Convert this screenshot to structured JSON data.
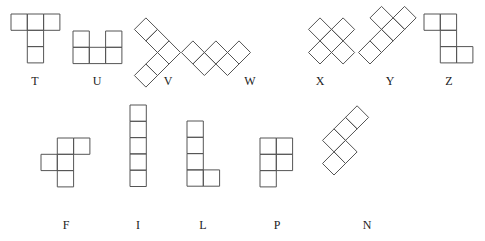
{
  "colors": {
    "stroke": "#555555",
    "text": "#222222",
    "background": "#ffffff"
  },
  "cell_size": 16.3,
  "pieces": [
    {
      "name": "T",
      "label_x": 35,
      "label_y": 76,
      "rotated": false,
      "ox": 11,
      "oy": 14,
      "cells": [
        [
          0,
          0
        ],
        [
          1,
          0
        ],
        [
          2,
          0
        ],
        [
          1,
          1
        ],
        [
          1,
          2
        ]
      ]
    },
    {
      "name": "U",
      "label_x": 97,
      "label_y": 76,
      "rotated": false,
      "ox": 73,
      "oy": 31,
      "cells": [
        [
          0,
          0
        ],
        [
          2,
          0
        ],
        [
          0,
          1
        ],
        [
          1,
          1
        ],
        [
          2,
          1
        ]
      ]
    },
    {
      "name": "V",
      "label_x": 168,
      "label_y": 76,
      "rotated": true,
      "ox": 169,
      "oy": 64,
      "cells": [
        [
          0,
          0
        ],
        [
          -1,
          0
        ],
        [
          -2,
          0
        ],
        [
          0,
          1
        ],
        [
          0,
          2
        ]
      ]
    },
    {
      "name": "W",
      "label_x": 250,
      "label_y": 76,
      "rotated": true,
      "ox": 239,
      "oy": 64,
      "cells": [
        [
          0,
          0
        ],
        [
          -1,
          0
        ],
        [
          -1,
          1
        ],
        [
          -2,
          1
        ],
        [
          -2,
          2
        ]
      ]
    },
    {
      "name": "X",
      "label_x": 320,
      "label_y": 76,
      "rotated": true,
      "ox": 320,
      "oy": 64,
      "cells": [
        [
          0,
          0
        ],
        [
          1,
          0
        ],
        [
          2,
          0
        ],
        [
          1,
          -1
        ],
        [
          1,
          1
        ]
      ]
    },
    {
      "name": "Y",
      "label_x": 390,
      "label_y": 76,
      "rotated": true,
      "ox": 370,
      "oy": 64,
      "cells": [
        [
          0,
          0
        ],
        [
          1,
          0
        ],
        [
          2,
          0
        ],
        [
          3,
          0
        ],
        [
          2,
          1
        ]
      ]
    },
    {
      "name": "Z",
      "label_x": 449,
      "label_y": 76,
      "rotated": false,
      "ox": 424,
      "oy": 14,
      "cells": [
        [
          0,
          0
        ],
        [
          1,
          0
        ],
        [
          1,
          1
        ],
        [
          1,
          2
        ],
        [
          2,
          2
        ]
      ]
    },
    {
      "name": "F",
      "label_x": 66,
      "label_y": 220,
      "rotated": false,
      "ox": 41,
      "oy": 138,
      "cells": [
        [
          1,
          0
        ],
        [
          2,
          0
        ],
        [
          0,
          1
        ],
        [
          1,
          1
        ],
        [
          1,
          2
        ]
      ]
    },
    {
      "name": "I",
      "label_x": 138,
      "label_y": 220,
      "rotated": false,
      "ox": 130,
      "oy": 105,
      "cells": [
        [
          0,
          0
        ],
        [
          0,
          1
        ],
        [
          0,
          2
        ],
        [
          0,
          3
        ],
        [
          0,
          4
        ]
      ]
    },
    {
      "name": "L",
      "label_x": 203,
      "label_y": 220,
      "rotated": false,
      "ox": 187,
      "oy": 121,
      "cells": [
        [
          0,
          0
        ],
        [
          0,
          1
        ],
        [
          0,
          2
        ],
        [
          0,
          3
        ],
        [
          1,
          3
        ]
      ]
    },
    {
      "name": "P",
      "label_x": 277,
      "label_y": 220,
      "rotated": false,
      "ox": 260,
      "oy": 138,
      "cells": [
        [
          0,
          0
        ],
        [
          1,
          0
        ],
        [
          0,
          1
        ],
        [
          1,
          1
        ],
        [
          0,
          2
        ]
      ]
    },
    {
      "name": "N",
      "label_x": 367,
      "label_y": 220,
      "rotated": true,
      "ox": 334,
      "oy": 175,
      "cells": [
        [
          0,
          0
        ],
        [
          1,
          0
        ],
        [
          1,
          1
        ],
        [
          2,
          1
        ],
        [
          3,
          1
        ]
      ]
    }
  ]
}
